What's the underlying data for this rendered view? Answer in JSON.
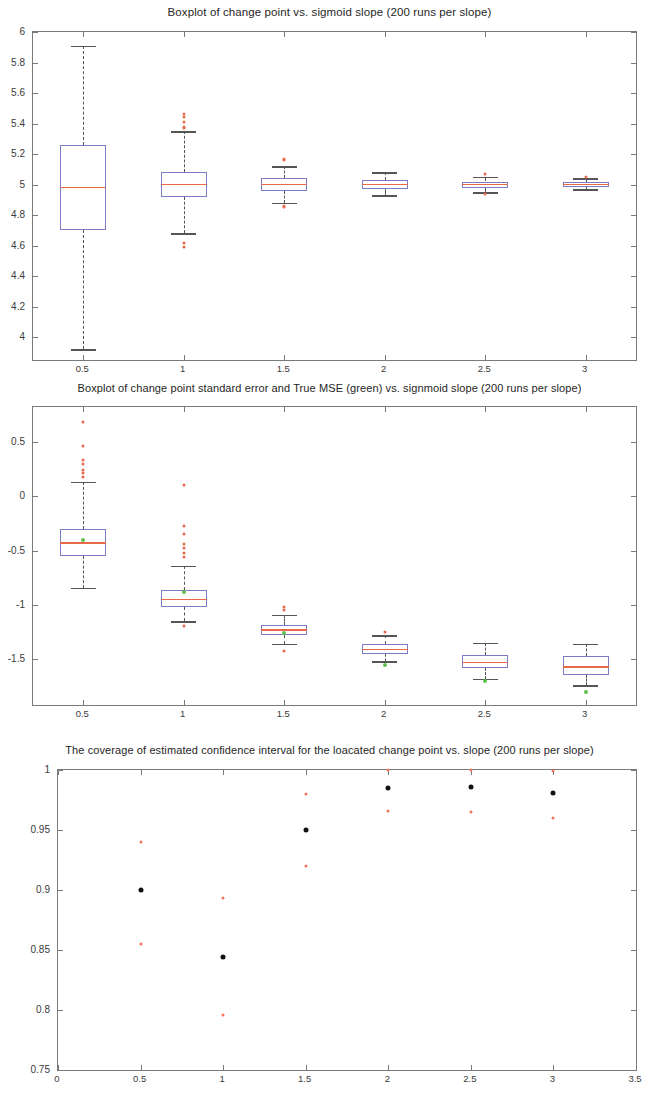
{
  "figure": {
    "width": 659,
    "height": 1111,
    "background": "#ffffff",
    "colors": {
      "box_edge": "#7b7bc8",
      "median": "#e8684a",
      "whisker": "#555555",
      "outlier": "#e8684a",
      "true_mse_marker": "#5cc24a",
      "coverage_point": "#111111",
      "coverage_bound": "#f1745a",
      "axis": "#7a7a7a"
    }
  },
  "chart_data": [
    {
      "type": "box",
      "id": "panel1",
      "title": "Boxplot of change point vs. sigmoid slope (200 runs per slope)",
      "xlabel": "",
      "ylabel": "",
      "categories": [
        "0.5",
        "1",
        "1.5",
        "2",
        "2.5",
        "3"
      ],
      "xlim": [
        0.25,
        3.25
      ],
      "ylim": [
        3.85,
        6.0
      ],
      "yticks": [
        6,
        5.8,
        5.6,
        5.4,
        5.2,
        5,
        4.8,
        4.6,
        4.4,
        4.2,
        4
      ],
      "ytick_labels": [
        "6",
        "5.8",
        "5.6",
        "5.4",
        "5.2",
        "5",
        "4.8",
        "4.6",
        "4.4",
        "4.2",
        "4"
      ],
      "xticks": [
        0.5,
        1,
        1.5,
        2,
        2.5,
        3
      ],
      "xtick_labels": [
        "0.5",
        "1",
        "1.5",
        "2",
        "2.5",
        "3"
      ],
      "grid": false,
      "boxes": [
        {
          "x": 0.5,
          "q1": 4.7,
          "median": 4.98,
          "q3": 5.26,
          "whisker_low": 3.92,
          "whisker_high": 5.91,
          "outliers": []
        },
        {
          "x": 1.0,
          "q1": 4.92,
          "median": 5.0,
          "q3": 5.08,
          "whisker_low": 4.68,
          "whisker_high": 5.35,
          "outliers": [
            5.46,
            5.44,
            5.41,
            5.38,
            5.37,
            4.62,
            4.59
          ]
        },
        {
          "x": 1.5,
          "q1": 4.96,
          "median": 5.0,
          "q3": 5.04,
          "whisker_low": 4.88,
          "whisker_high": 5.12,
          "outliers": [
            5.17,
            5.16,
            4.86,
            4.85
          ]
        },
        {
          "x": 2.0,
          "q1": 4.97,
          "median": 5.0,
          "q3": 5.03,
          "whisker_low": 4.93,
          "whisker_high": 5.08,
          "outliers": []
        },
        {
          "x": 2.5,
          "q1": 4.98,
          "median": 5.0,
          "q3": 5.02,
          "whisker_low": 4.95,
          "whisker_high": 5.05,
          "outliers": [
            5.07,
            4.94
          ]
        },
        {
          "x": 3.0,
          "q1": 4.985,
          "median": 5.0,
          "q3": 5.015,
          "whisker_low": 4.97,
          "whisker_high": 5.04,
          "outliers": [
            5.05
          ]
        }
      ]
    },
    {
      "type": "box",
      "id": "panel2",
      "title": "Boxplot of change point standard error and True MSE (green) vs. signmoid slope (200 runs per slope)",
      "xlabel": "",
      "ylabel": "",
      "categories": [
        "0.5",
        "1",
        "1.5",
        "2",
        "2.5",
        "3"
      ],
      "xlim": [
        0.25,
        3.25
      ],
      "ylim": [
        -1.92,
        0.82
      ],
      "yticks": [
        0.5,
        0,
        -0.5,
        -1,
        -1.5
      ],
      "ytick_labels": [
        "0.5",
        "0",
        "-0.5",
        "-1",
        "-1.5"
      ],
      "xticks": [
        0.5,
        1,
        1.5,
        2,
        2.5,
        3
      ],
      "xtick_labels": [
        "0.5",
        "1",
        "1.5",
        "2",
        "2.5",
        "3"
      ],
      "grid": false,
      "legend": [
        {
          "label": "True MSE (green)",
          "color": "#5cc24a"
        }
      ],
      "boxes": [
        {
          "x": 0.5,
          "q1": -0.55,
          "median": -0.43,
          "q3": -0.3,
          "whisker_low": -0.84,
          "whisker_high": 0.13,
          "outliers": [
            0.68,
            0.46,
            0.33,
            0.3,
            0.24,
            0.21,
            0.18
          ],
          "true_mse": -0.4
        },
        {
          "x": 1.0,
          "q1": -1.02,
          "median": -0.95,
          "q3": -0.86,
          "whisker_low": -1.15,
          "whisker_high": -0.64,
          "outliers": [
            0.1,
            -0.27,
            -0.35,
            -0.44,
            -0.48,
            -0.52,
            -0.56,
            -1.19
          ],
          "true_mse": -0.88
        },
        {
          "x": 1.5,
          "q1": -1.28,
          "median": -1.23,
          "q3": -1.18,
          "whisker_low": -1.36,
          "whisker_high": -1.09,
          "outliers": [
            -1.02,
            -1.05,
            -1.42
          ],
          "true_mse": -1.26
        },
        {
          "x": 2.0,
          "q1": -1.45,
          "median": -1.41,
          "q3": -1.36,
          "whisker_low": -1.52,
          "whisker_high": -1.28,
          "outliers": [
            -1.25
          ],
          "true_mse": -1.55
        },
        {
          "x": 2.5,
          "q1": -1.58,
          "median": -1.53,
          "q3": -1.46,
          "whisker_low": -1.68,
          "whisker_high": -1.35,
          "outliers": [],
          "true_mse": -1.7
        },
        {
          "x": 3.0,
          "q1": -1.64,
          "median": -1.57,
          "q3": -1.47,
          "whisker_low": -1.74,
          "whisker_high": -1.36,
          "outliers": [],
          "true_mse": -1.8
        }
      ]
    },
    {
      "type": "scatter",
      "id": "panel3",
      "title": "The coverage of estimated confidence interval for the loacated change point vs. slope (200 runs per slope)",
      "xlabel": "",
      "ylabel": "",
      "xlim": [
        0,
        3.5
      ],
      "ylim": [
        0.75,
        1.0
      ],
      "yticks": [
        1,
        0.95,
        0.9,
        0.85,
        0.8,
        0.75
      ],
      "ytick_labels": [
        "1",
        "0.95",
        "0.9",
        "0.85",
        "0.8",
        "0.75"
      ],
      "xticks": [
        0,
        0.5,
        1,
        1.5,
        2,
        2.5,
        3,
        3.5
      ],
      "xtick_labels": [
        "0",
        "0.5",
        "1",
        "1.5",
        "2",
        "2.5",
        "3",
        "3.5"
      ],
      "grid": false,
      "series": [
        {
          "name": "coverage",
          "marker": "black-dot",
          "x": [
            0.5,
            1,
            1.5,
            2,
            2.5,
            3
          ],
          "values": [
            0.9,
            0.844,
            0.95,
            0.985,
            0.986,
            0.981
          ]
        },
        {
          "name": "upper bound",
          "marker": "red-dot",
          "x": [
            0.5,
            1,
            1.5,
            2,
            2.5,
            3
          ],
          "values": [
            0.94,
            0.893,
            0.98,
            1.0,
            1.0,
            0.999
          ]
        },
        {
          "name": "lower bound",
          "marker": "red-dot",
          "x": [
            0.5,
            1,
            1.5,
            2,
            2.5,
            3
          ],
          "values": [
            0.855,
            0.796,
            0.92,
            0.966,
            0.965,
            0.96
          ]
        }
      ]
    }
  ]
}
